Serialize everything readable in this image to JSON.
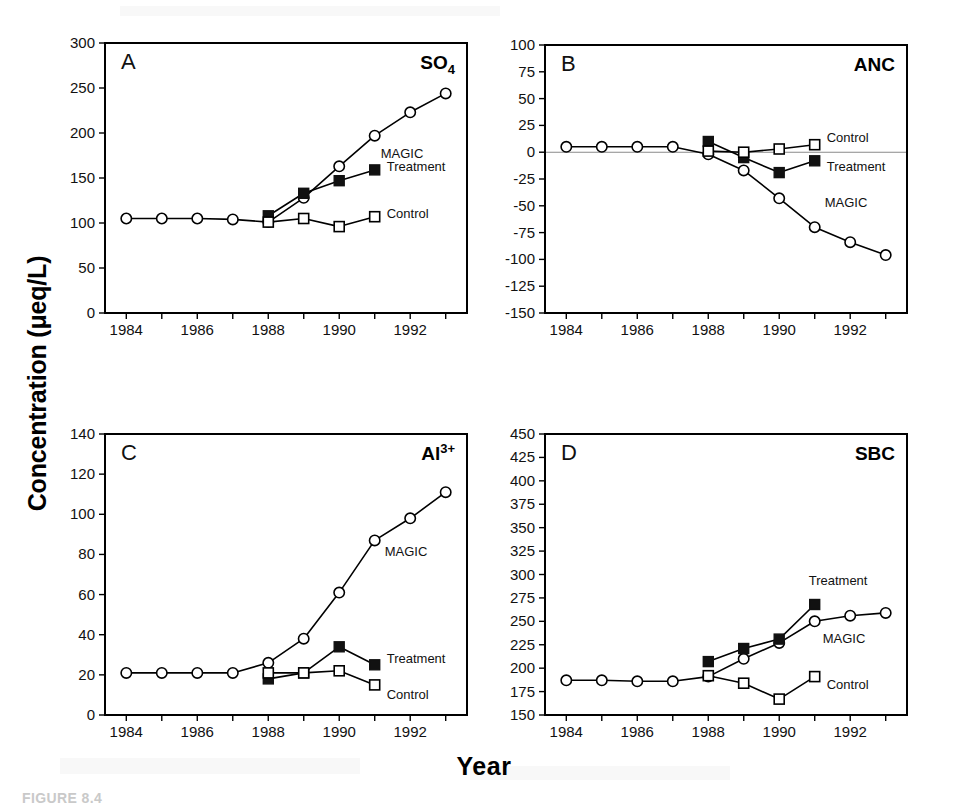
{
  "figure": {
    "caption": "FIGURE 8.4",
    "y_axis_label": "Concentration (μeq/L)",
    "x_axis_label": "Year",
    "series_names": [
      "MAGIC",
      "Treatment",
      "Control"
    ],
    "marker_styles": {
      "MAGIC": "open-circle",
      "Treatment": "filled-square",
      "Control": "open-square"
    }
  },
  "chart_data": [
    {
      "type": "line",
      "panel": "A",
      "title": "SO4",
      "title_base": "SO",
      "title_sub": "4",
      "xlabel": "Year",
      "ylabel": "Concentration (μeq/L)",
      "xlim": [
        1983.4,
        1993.6
      ],
      "ylim": [
        0,
        300
      ],
      "yticks": [
        0,
        50,
        100,
        150,
        200,
        250,
        300
      ],
      "ytick_labels": [
        "0",
        "50",
        "100",
        "150",
        "200",
        "250",
        "300"
      ],
      "xticks": [
        1984,
        1985,
        1986,
        1987,
        1988,
        1989,
        1990,
        1991,
        1992,
        1993
      ],
      "xtick_labels": [
        "1984",
        "",
        "1986",
        "",
        "1988",
        "",
        "1990",
        "",
        "1992",
        ""
      ],
      "grid": false,
      "legend_position": "inline-end-of-series",
      "series": [
        {
          "name": "MAGIC",
          "marker": "open-circle",
          "x": [
            1984,
            1985,
            1986,
            1987,
            1988,
            1989,
            1990,
            1991,
            1992,
            1993
          ],
          "values": [
            105,
            105,
            105,
            104,
            101,
            128,
            163,
            197,
            223,
            244
          ]
        },
        {
          "name": "Treatment",
          "marker": "filled-square",
          "x": [
            1988,
            1989,
            1990,
            1991
          ],
          "values": [
            108,
            133,
            147,
            159
          ]
        },
        {
          "name": "Control",
          "marker": "open-square",
          "x": [
            1988,
            1989,
            1990,
            1991
          ],
          "values": [
            101,
            105,
            96,
            107
          ]
        }
      ]
    },
    {
      "type": "line",
      "panel": "B",
      "title": "ANC",
      "title_base": "ANC",
      "title_sub": "",
      "xlabel": "Year",
      "ylabel": "Concentration (μeq/L)",
      "xlim": [
        1983.4,
        1993.6
      ],
      "ylim": [
        -150,
        100
      ],
      "yticks": [
        -150,
        -125,
        -100,
        -75,
        -50,
        -25,
        0,
        25,
        50,
        75,
        100
      ],
      "ytick_labels": [
        "-150",
        "-125",
        "-100",
        "-75",
        "-50",
        "-25",
        "0",
        "25",
        "50",
        "75",
        "100"
      ],
      "xticks": [
        1984,
        1985,
        1986,
        1987,
        1988,
        1989,
        1990,
        1991,
        1992,
        1993
      ],
      "xtick_labels": [
        "1984",
        "",
        "1986",
        "",
        "1988",
        "",
        "1990",
        "",
        "1992",
        ""
      ],
      "grid": false,
      "zero_reference_line": 0,
      "legend_position": "inline-end-of-series",
      "series": [
        {
          "name": "MAGIC",
          "marker": "open-circle",
          "x": [
            1984,
            1985,
            1986,
            1987,
            1988,
            1989,
            1990,
            1991,
            1992,
            1993
          ],
          "values": [
            5,
            5,
            5,
            5,
            -2,
            -17,
            -43,
            -70,
            -84,
            -96
          ]
        },
        {
          "name": "Treatment",
          "marker": "filled-square",
          "x": [
            1988,
            1989,
            1990,
            1991
          ],
          "values": [
            10,
            -5,
            -19,
            -8
          ]
        },
        {
          "name": "Control",
          "marker": "open-square",
          "x": [
            1988,
            1989,
            1990,
            1991
          ],
          "values": [
            1,
            0,
            3,
            7
          ]
        }
      ]
    },
    {
      "type": "line",
      "panel": "C",
      "title": "Al3+",
      "title_base": "Al",
      "title_sub": "3+",
      "xlabel": "Year",
      "ylabel": "Concentration (μeq/L)",
      "xlim": [
        1983.4,
        1993.6
      ],
      "ylim": [
        0,
        140
      ],
      "yticks": [
        0,
        20,
        40,
        60,
        80,
        100,
        120,
        140
      ],
      "ytick_labels": [
        "0",
        "20",
        "40",
        "60",
        "80",
        "100",
        "120",
        "140"
      ],
      "xticks": [
        1984,
        1985,
        1986,
        1987,
        1988,
        1989,
        1990,
        1991,
        1992,
        1993
      ],
      "xtick_labels": [
        "1984",
        "",
        "1986",
        "",
        "1988",
        "",
        "1990",
        "",
        "1992",
        ""
      ],
      "grid": false,
      "legend_position": "inline-end-of-series",
      "series": [
        {
          "name": "MAGIC",
          "marker": "open-circle",
          "x": [
            1984,
            1985,
            1986,
            1987,
            1988,
            1989,
            1990,
            1991,
            1992,
            1993
          ],
          "values": [
            21,
            21,
            21,
            21,
            26,
            38,
            61,
            87,
            98,
            111
          ]
        },
        {
          "name": "Treatment",
          "marker": "filled-square",
          "x": [
            1988,
            1989,
            1990,
            1991
          ],
          "values": [
            18,
            21,
            34,
            25
          ]
        },
        {
          "name": "Control",
          "marker": "open-square",
          "x": [
            1988,
            1989,
            1990,
            1991
          ],
          "values": [
            21,
            21,
            22,
            15
          ]
        }
      ]
    },
    {
      "type": "line",
      "panel": "D",
      "title": "SBC",
      "title_base": "SBC",
      "title_sub": "",
      "xlabel": "Year",
      "ylabel": "Concentration (μeq/L)",
      "xlim": [
        1983.4,
        1993.6
      ],
      "ylim": [
        150,
        450
      ],
      "yticks": [
        150,
        175,
        200,
        225,
        250,
        275,
        300,
        325,
        350,
        375,
        400,
        425,
        450
      ],
      "ytick_labels": [
        "150",
        "175",
        "200",
        "225",
        "250",
        "275",
        "300",
        "325",
        "350",
        "375",
        "400",
        "425",
        "450"
      ],
      "xticks": [
        1984,
        1985,
        1986,
        1987,
        1988,
        1989,
        1990,
        1991,
        1992,
        1993
      ],
      "xtick_labels": [
        "1984",
        "",
        "1986",
        "",
        "1988",
        "",
        "1990",
        "",
        "1992",
        ""
      ],
      "grid": false,
      "legend_position": "inline-end-of-series",
      "series": [
        {
          "name": "MAGIC",
          "marker": "open-circle",
          "x": [
            1984,
            1985,
            1986,
            1987,
            1988,
            1989,
            1990,
            1991,
            1992,
            1993
          ],
          "values": [
            187,
            187,
            186,
            186,
            191,
            210,
            227,
            250,
            256,
            259
          ]
        },
        {
          "name": "Treatment",
          "marker": "filled-square",
          "x": [
            1988,
            1989,
            1990,
            1991
          ],
          "values": [
            207,
            221,
            231,
            268
          ]
        },
        {
          "name": "Control",
          "marker": "open-square",
          "x": [
            1988,
            1989,
            1990,
            1991
          ],
          "values": [
            192,
            184,
            167,
            191
          ]
        }
      ]
    }
  ],
  "panels": {
    "A": {
      "letter": "A",
      "series_labels": [
        {
          "name": "MAGIC",
          "text": "MAGIC"
        },
        {
          "name": "Treatment",
          "text": "Treatment"
        },
        {
          "name": "Control",
          "text": "Control"
        }
      ]
    },
    "B": {
      "letter": "B",
      "series_labels": [
        {
          "name": "Control",
          "text": "Control"
        },
        {
          "name": "Treatment",
          "text": "Treatment"
        },
        {
          "name": "MAGIC",
          "text": "MAGIC"
        }
      ]
    },
    "C": {
      "letter": "C",
      "series_labels": [
        {
          "name": "MAGIC",
          "text": "MAGIC"
        },
        {
          "name": "Treatment",
          "text": "Treatment"
        },
        {
          "name": "Control",
          "text": "Control"
        }
      ]
    },
    "D": {
      "letter": "D",
      "series_labels": [
        {
          "name": "Treatment",
          "text": "Treatment"
        },
        {
          "name": "MAGIC",
          "text": "MAGIC"
        },
        {
          "name": "Control",
          "text": "Control"
        }
      ]
    }
  }
}
